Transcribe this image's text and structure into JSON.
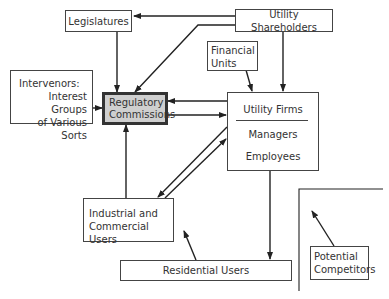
{
  "diagram": {
    "nodes": {
      "legislatures": "Legislatures",
      "utility_shareholders": "Utility Shareholders",
      "financial_units": [
        "Financial",
        "Units"
      ],
      "intervenors": [
        "Intervenors:",
        "Interest Groups",
        "of Various Sorts"
      ],
      "regulatory_commissions": [
        "Regulatory",
        "Commissions"
      ],
      "utility_firms": {
        "title": "Utility Firms",
        "members": [
          "Managers",
          "Employees"
        ]
      },
      "industrial_commercial": [
        "Industrial and",
        "Commercial Users"
      ],
      "residential_users": "Residential Users",
      "potential_competitors": [
        "Potential",
        "Competitors"
      ]
    },
    "edges": [
      {
        "from": "Utility Shareholders",
        "to": "Legislatures"
      },
      {
        "from": "Utility Shareholders",
        "to": "Regulatory Commissions"
      },
      {
        "from": "Utility Shareholders",
        "to": "Utility Firms"
      },
      {
        "from": "Legislatures",
        "to": "Regulatory Commissions"
      },
      {
        "from": "Intervenors",
        "to": "Regulatory Commissions"
      },
      {
        "from": "Financial Units",
        "to": "Utility Firms"
      },
      {
        "from": "Utility Firms",
        "to": "Regulatory Commissions"
      },
      {
        "from": "Regulatory Commissions",
        "to": "Utility Firms"
      },
      {
        "from": "Industrial and Commercial Users",
        "to": "Regulatory Commissions"
      },
      {
        "from": "Utility Firms",
        "to": "Industrial and Commercial Users"
      },
      {
        "from": "Industrial and Commercial Users",
        "to": "Utility Firms"
      },
      {
        "from": "Utility Firms",
        "to": "Residential Users"
      },
      {
        "from": "Residential Users",
        "to": "Industrial and Commercial Users"
      },
      {
        "from": "Potential Competitors",
        "to": "market boundary"
      }
    ],
    "colors": {
      "line": "#333333",
      "regulatory_fill": "#cfcfcf"
    }
  }
}
